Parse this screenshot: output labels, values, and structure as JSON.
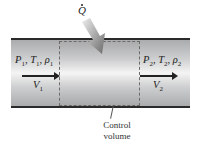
{
  "diagram": {
    "heat": {
      "symbol": "Q",
      "dot": true
    },
    "inlet": {
      "state": [
        "P",
        "1",
        "T",
        "1",
        "ρ",
        "1"
      ],
      "velocity": [
        "V",
        "1"
      ]
    },
    "outlet": {
      "state": [
        "P",
        "2",
        "T",
        "2",
        "ρ",
        "2"
      ],
      "velocity": [
        "V",
        "2"
      ]
    },
    "control_volume": {
      "line1": "Control",
      "line2": "volume"
    }
  }
}
